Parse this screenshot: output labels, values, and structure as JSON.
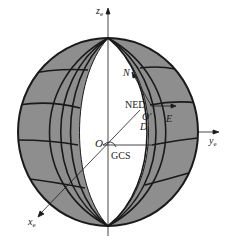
{
  "diagram": {
    "title": "",
    "axes": {
      "z": {
        "label": "z",
        "subscript": "e"
      },
      "y": {
        "label": "y",
        "subscript": "e"
      },
      "x": {
        "label": "x",
        "subscript": "e"
      }
    },
    "origin": {
      "label": "O"
    },
    "frames": {
      "gcs": {
        "label": "GCS"
      },
      "ned": {
        "label": "NED",
        "origin_label": "O'",
        "north": "N",
        "east": "E",
        "down": "D"
      }
    },
    "colors": {
      "shade": "#8e8e8e",
      "line": "#1a1a1a",
      "background": "#ffffff"
    }
  }
}
